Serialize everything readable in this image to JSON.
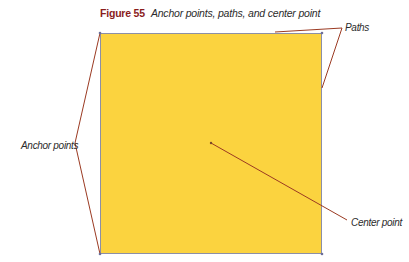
{
  "figure": {
    "number": "Figure 55",
    "caption": "Anchor points, paths, and center point"
  },
  "shape": {
    "type": "square",
    "fill_color": "#fbd33f",
    "stroke_color": "#8c8fa6"
  },
  "callouts": {
    "paths": "Paths",
    "anchor_points": "Anchor points",
    "center_point": "Center point",
    "line_color": "#9b3a22"
  }
}
